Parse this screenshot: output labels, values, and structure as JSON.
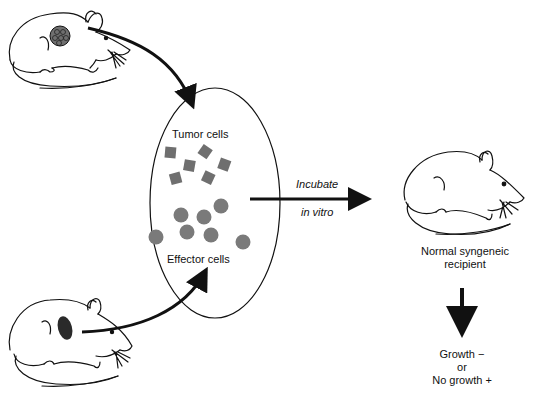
{
  "diagram": {
    "labels": {
      "tumor_cells": "Tumor cells",
      "effector_cells": "Effector cells",
      "incubate": "Incubate",
      "in_vitro": "in vitro",
      "recipient_line1": "Normal syngeneic",
      "recipient_line2": "recipient",
      "outcome_line1": "Growth −",
      "outcome_line2": "or",
      "outcome_line3": "No growth +"
    },
    "nodes": [
      {
        "id": "tumor-donor-mouse",
        "icon": "mouse-with-tumor-icon"
      },
      {
        "id": "effector-donor-mouse",
        "icon": "mouse-with-spleen-icon"
      },
      {
        "id": "incubation-vessel",
        "icon": "ellipse"
      },
      {
        "id": "recipient-mouse",
        "icon": "mouse-icon"
      }
    ],
    "colors": {
      "line": "#111111",
      "cell_fill": "#7a7a7a",
      "tumor_fill": "#6f6f6f",
      "spleen_fill": "#2a2a2a"
    }
  }
}
